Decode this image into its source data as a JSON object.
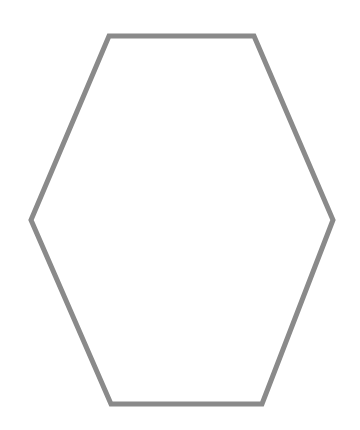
{
  "diagram": {
    "shape": "hexagon",
    "orientation": "flat-top",
    "fill": "none",
    "stroke_color": "#8a8a8a",
    "background_color": "#ffffff",
    "labels": []
  }
}
